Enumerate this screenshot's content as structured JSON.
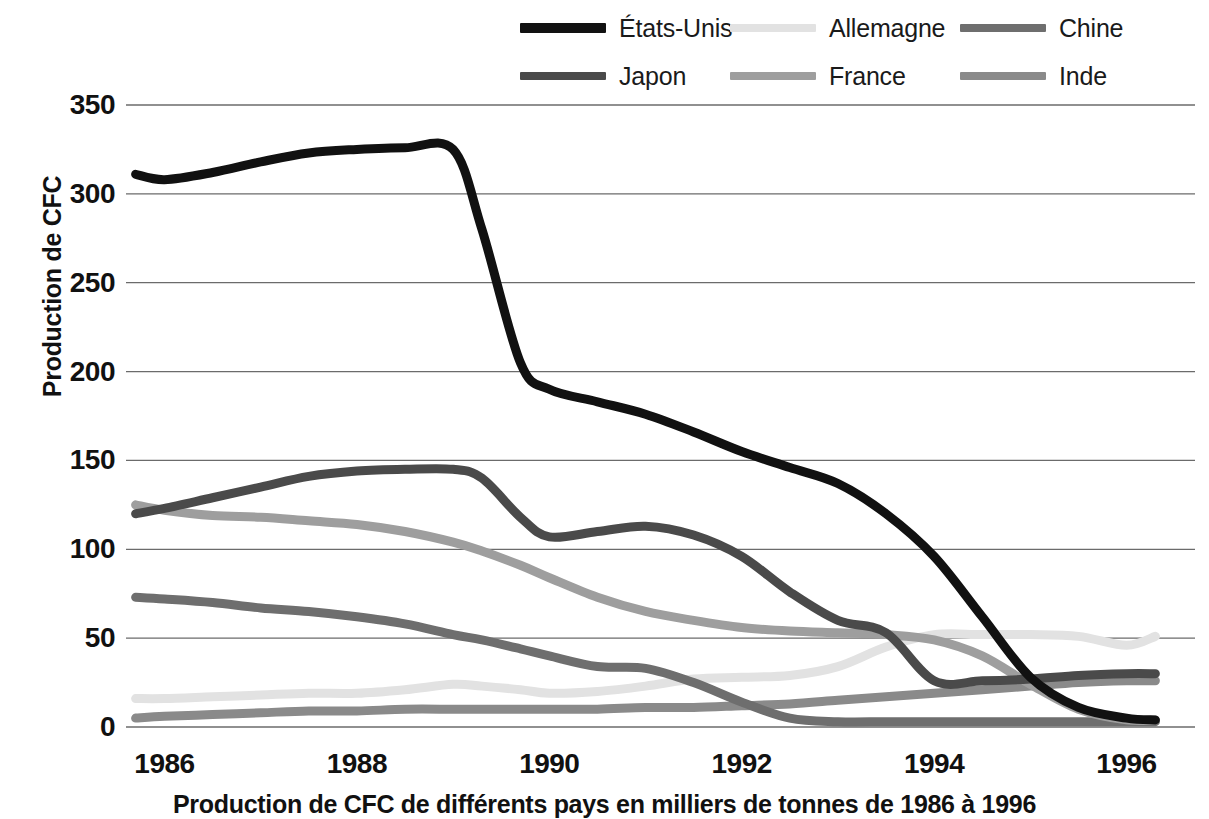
{
  "chart_data": {
    "type": "line",
    "title": "",
    "caption": "Production de CFC de différents pays en milliers de tonnes de 1986 à 1996",
    "xlabel": "",
    "ylabel": "Production de CFC",
    "xlim": [
      1985.6,
      1996.4
    ],
    "ylim": [
      0,
      350
    ],
    "grid": true,
    "legend_position": "top",
    "ytick_labels": [
      "350",
      "300",
      "250",
      "200",
      "150",
      "100",
      "50",
      "0"
    ],
    "ytick_values": [
      350,
      300,
      250,
      200,
      150,
      100,
      50,
      0
    ],
    "xtick_labels": [
      "1986",
      "1988",
      "1990",
      "1992",
      "1994",
      "1996"
    ],
    "xtick_values": [
      1986,
      1988,
      1990,
      1992,
      1994,
      1996
    ],
    "x": [
      1985.7,
      1986,
      1986.5,
      1987,
      1987.5,
      1988,
      1988.5,
      1989,
      1989.3,
      1989.7,
      1990,
      1990.5,
      1991,
      1991.5,
      1992,
      1992.5,
      1993,
      1993.5,
      1994,
      1994.5,
      1995,
      1995.5,
      1996,
      1996.3
    ],
    "series": [
      {
        "name": "États-Unis",
        "color": "#111111",
        "width": 9,
        "values": [
          311,
          308,
          312,
          318,
          323,
          325,
          326,
          325,
          280,
          205,
          190,
          183,
          176,
          166,
          155,
          146,
          137,
          120,
          96,
          62,
          28,
          11,
          5,
          4
        ]
      },
      {
        "name": "Allemagne",
        "color": "#e2e2e2",
        "width": 9,
        "values": [
          16,
          16,
          17,
          18,
          19,
          19,
          21,
          24,
          23,
          21,
          19,
          20,
          23,
          27,
          28,
          29,
          34,
          45,
          52,
          52,
          52,
          51,
          46,
          51
        ]
      },
      {
        "name": "Chine",
        "color": "#6e6e6e",
        "width": 9,
        "values": [
          73,
          72,
          70,
          67,
          65,
          62,
          58,
          52,
          49,
          44,
          40,
          34,
          33,
          25,
          14,
          5,
          3,
          3,
          3,
          3,
          3,
          3,
          3,
          3
        ]
      },
      {
        "name": "Japon",
        "color": "#4a4a4a",
        "width": 9,
        "values": [
          120,
          123,
          129,
          135,
          141,
          144,
          145,
          145,
          140,
          118,
          107,
          110,
          113,
          108,
          96,
          76,
          60,
          53,
          26,
          26,
          27,
          29,
          30,
          30
        ]
      },
      {
        "name": "France",
        "color": "#9e9e9e",
        "width": 9,
        "values": [
          125,
          122,
          119,
          118,
          116,
          114,
          110,
          104,
          99,
          91,
          84,
          73,
          65,
          60,
          56,
          54,
          53,
          52,
          49,
          40,
          24,
          10,
          4,
          4
        ]
      },
      {
        "name": "Inde",
        "color": "#8a8a8a",
        "width": 9,
        "values": [
          5,
          6,
          7,
          8,
          9,
          9,
          10,
          10,
          10,
          10,
          10,
          10,
          11,
          11,
          12,
          13,
          15,
          17,
          19,
          21,
          23,
          25,
          26,
          26
        ]
      }
    ],
    "legend_entries": [
      {
        "label": "États-Unis",
        "color": "#111111"
      },
      {
        "label": "Allemagne",
        "color": "#e2e2e2"
      },
      {
        "label": "Chine",
        "color": "#6e6e6e"
      },
      {
        "label": "Japon",
        "color": "#4a4a4a"
      },
      {
        "label": "France",
        "color": "#9e9e9e"
      },
      {
        "label": "Inde",
        "color": "#8a8a8a"
      }
    ],
    "gridline_color": "#6b6b6b"
  }
}
